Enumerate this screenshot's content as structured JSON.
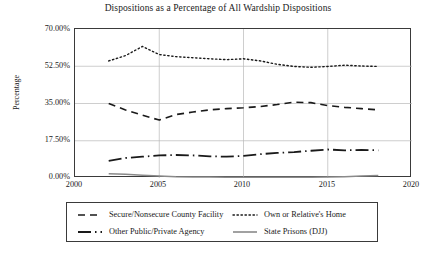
{
  "chart_data": {
    "type": "line",
    "title": "Dispositions as a Percentage of All Wardship Dispositions",
    "xlabel": "",
    "ylabel": "Percentage",
    "xlim": [
      2000,
      2020
    ],
    "ylim": [
      0,
      70
    ],
    "xticks": [
      "2000",
      "2005",
      "2010",
      "2015",
      "2020"
    ],
    "yticks": [
      "0.00%",
      "17.50%",
      "35.00%",
      "52.50%",
      "70.00%"
    ],
    "grid": true,
    "legend_position": "below",
    "x": [
      2002,
      2003,
      2004,
      2005,
      2006,
      2007,
      2008,
      2009,
      2010,
      2011,
      2012,
      2013,
      2014,
      2015,
      2016,
      2017,
      2018
    ],
    "series": [
      {
        "name": "Secure/Nonsecure County Facility",
        "style": "dashed",
        "color": "#1a1a1a",
        "values": [
          35.0,
          32.0,
          29.5,
          27.2,
          29.8,
          31.0,
          32.0,
          32.6,
          33.0,
          33.6,
          34.5,
          35.6,
          35.4,
          34.0,
          33.2,
          32.6,
          32.0
        ]
      },
      {
        "name": "Own or Relative's Home",
        "style": "dotted",
        "color": "#1a1a1a",
        "values": [
          55.0,
          57.5,
          61.8,
          58.0,
          57.0,
          56.5,
          56.0,
          55.6,
          56.0,
          55.0,
          53.4,
          52.4,
          52.0,
          52.4,
          53.0,
          52.6,
          52.4
        ]
      },
      {
        "name": "Other Public/Private Agency",
        "style": "dashdot",
        "color": "#1a1a1a",
        "values": [
          8.0,
          9.4,
          10.0,
          10.6,
          10.8,
          10.6,
          10.2,
          10.0,
          10.4,
          11.2,
          11.8,
          12.2,
          12.8,
          13.4,
          13.0,
          13.2,
          13.0
        ]
      },
      {
        "name": "State Prisons (DJJ)",
        "style": "solid",
        "color": "#8a8a8a",
        "values": [
          2.0,
          1.8,
          1.3,
          0.9,
          0.6,
          0.5,
          0.45,
          0.4,
          0.4,
          0.4,
          0.4,
          0.4,
          0.4,
          0.45,
          0.6,
          0.9,
          1.2
        ]
      }
    ]
  },
  "legend": {
    "entries": [
      {
        "label": "Secure/Nonsecure County Facility"
      },
      {
        "label": "Own or Relative's Home"
      },
      {
        "label": "Other Public/Private Agency"
      },
      {
        "label": "State Prisons (DJJ)"
      }
    ]
  }
}
